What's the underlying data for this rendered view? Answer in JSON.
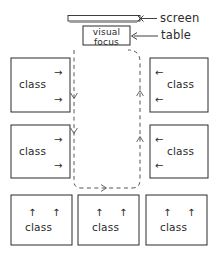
{
  "diagram": {
    "stroke_color": "#2b2b2b",
    "background_color": "#ffffff",
    "dashed_path_color": "#555555"
  },
  "screen": {
    "name": "screen",
    "label": "screen",
    "marker": "x"
  },
  "table": {
    "name": "table",
    "label": "table",
    "box_text_line1": "visual",
    "box_text_line2": "focus"
  },
  "classes": {
    "label": "class",
    "left": [
      {
        "label": "class",
        "arrows": [
          "→",
          "→"
        ]
      },
      {
        "label": "class",
        "arrows": [
          "→",
          "→"
        ]
      }
    ],
    "right": [
      {
        "label": "class",
        "arrows": [
          "←",
          "←"
        ]
      },
      {
        "label": "class",
        "arrows": [
          "←",
          "←"
        ]
      }
    ],
    "bottom": [
      {
        "label": "class",
        "arrows": [
          "↑",
          "↑"
        ]
      },
      {
        "label": "class",
        "arrows": [
          "↑",
          "↑"
        ]
      },
      {
        "label": "class",
        "arrows": [
          "↑",
          "↑"
        ]
      }
    ]
  },
  "path": {
    "name": "circulation-path",
    "style": "dashed",
    "direction_arrows": [
      "↓",
      "↓",
      "→",
      "↑",
      "↑"
    ]
  }
}
